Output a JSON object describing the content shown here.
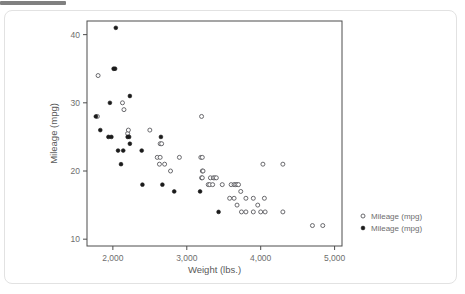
{
  "window": {
    "top_bar_label": ""
  },
  "chart_data": {
    "type": "scatter",
    "title": "",
    "xlabel": "Weight (lbs.)",
    "ylabel": "Mileage (mpg)",
    "xlim": [
      1650,
      5100
    ],
    "ylim": [
      9,
      42
    ],
    "xticks": [
      2000,
      3000,
      4000,
      5000
    ],
    "xticklabels": [
      "2,000",
      "3,000",
      "4,000",
      "5,000"
    ],
    "yticks": [
      10,
      20,
      30,
      40
    ],
    "yticklabels": [
      "10",
      "20",
      "30",
      "40"
    ],
    "grid": false,
    "legend_position": "right",
    "colors": {
      "hollow_marker_stroke": "#59595e",
      "filled_marker_fill": "#1b1b1b",
      "axis": "#4d4d4d",
      "tick_text": "#6e6e6e",
      "card_border": "#e2e2e2",
      "top_bar": "#808080",
      "background": "#ffffff"
    },
    "series": [
      {
        "name": "Mileage (mpg)",
        "marker": "open-circle",
        "legend_label": "Mileage (mpg)",
        "points": [
          [
            1800,
            34
          ],
          [
            2130,
            30
          ],
          [
            2150,
            29
          ],
          [
            2200,
            25.5
          ],
          [
            2210,
            26
          ],
          [
            2500,
            26
          ],
          [
            2640,
            24
          ],
          [
            2660,
            24
          ],
          [
            2600,
            22
          ],
          [
            2640,
            22
          ],
          [
            2630,
            21
          ],
          [
            2700,
            21
          ],
          [
            2780,
            20
          ],
          [
            2900,
            22
          ],
          [
            3190,
            22
          ],
          [
            3210,
            22
          ],
          [
            3200,
            28
          ],
          [
            3210,
            20
          ],
          [
            3220,
            20
          ],
          [
            3200,
            19
          ],
          [
            3210,
            19
          ],
          [
            3320,
            19
          ],
          [
            3360,
            19
          ],
          [
            3380,
            19
          ],
          [
            3400,
            19
          ],
          [
            3290,
            18
          ],
          [
            3310,
            18
          ],
          [
            3350,
            18
          ],
          [
            3480,
            18
          ],
          [
            3600,
            18
          ],
          [
            3640,
            18
          ],
          [
            3660,
            18
          ],
          [
            3680,
            18
          ],
          [
            3700,
            18
          ],
          [
            3730,
            17
          ],
          [
            3580,
            16
          ],
          [
            3640,
            16
          ],
          [
            3680,
            15
          ],
          [
            3800,
            16
          ],
          [
            3900,
            16
          ],
          [
            3960,
            15
          ],
          [
            4030,
            21
          ],
          [
            4050,
            16
          ],
          [
            4300,
            21
          ],
          [
            3740,
            14
          ],
          [
            3800,
            14
          ],
          [
            3900,
            14
          ],
          [
            4000,
            14
          ],
          [
            4060,
            14
          ],
          [
            4300,
            14
          ],
          [
            4700,
            12
          ],
          [
            4840,
            12
          ],
          [
            1790,
            28
          ]
        ]
      },
      {
        "name": "Mileage (mpg)",
        "marker": "filled-circle",
        "legend_label": "Mileage (mpg)",
        "points": [
          [
            2040,
            41
          ],
          [
            2010,
            35
          ],
          [
            2030,
            35
          ],
          [
            1960,
            30
          ],
          [
            2230,
            31
          ],
          [
            1770,
            28
          ],
          [
            1830,
            26
          ],
          [
            1940,
            25
          ],
          [
            1980,
            25
          ],
          [
            2200,
            25
          ],
          [
            2220,
            25
          ],
          [
            2650,
            25
          ],
          [
            2070,
            23
          ],
          [
            2140,
            23
          ],
          [
            2390,
            23
          ],
          [
            2230,
            24
          ],
          [
            2110,
            21
          ],
          [
            2400,
            18
          ],
          [
            2670,
            18
          ],
          [
            2830,
            17
          ],
          [
            3180,
            17
          ],
          [
            3430,
            14
          ]
        ]
      }
    ]
  },
  "legend": {
    "entries": [
      {
        "label": "Mileage (mpg)",
        "marker": "open-circle"
      },
      {
        "label": "Mileage (mpg)",
        "marker": "filled-circle"
      }
    ]
  }
}
